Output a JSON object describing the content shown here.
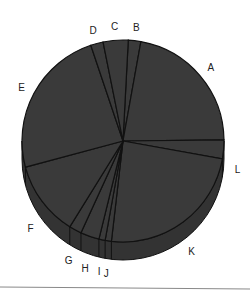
{
  "chart_data": {
    "type": "pie",
    "style": "3d-tilted",
    "title": "",
    "categories": [
      "A",
      "B",
      "C",
      "D",
      "E",
      "F",
      "G",
      "H",
      "I",
      "J",
      "K",
      "L"
    ],
    "values": [
      22,
      2,
      4,
      2,
      24,
      12,
      2,
      3,
      1,
      1,
      24,
      3
    ],
    "order_clockwise_from_top": [
      "B",
      "A",
      "L",
      "K",
      "J",
      "I",
      "H",
      "G",
      "F",
      "E",
      "D",
      "C"
    ],
    "legend": "none",
    "labels_outside": true,
    "colors": {
      "slice_fill": "#3a3a3a",
      "side_fill": "#333333",
      "edge": "#111111",
      "label": "#222222",
      "rule": "#888888"
    }
  }
}
